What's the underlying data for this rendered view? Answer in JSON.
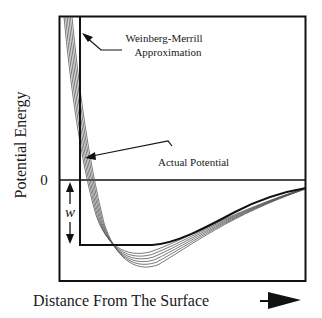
{
  "diagram": {
    "y_axis_label": "Potential Energy",
    "x_axis_label": "Distance From The Surface",
    "zero_label": "0",
    "well_depth_label": "w",
    "annotations": [
      {
        "id": "approx",
        "lines": [
          "Weinberg-Merrill",
          "Approximation"
        ]
      },
      {
        "id": "actual",
        "lines": [
          "Actual Potential"
        ]
      }
    ],
    "curve_count": 6,
    "colors": {
      "line": "#111111",
      "curves": "#555555",
      "background": "#ffffff"
    }
  }
}
